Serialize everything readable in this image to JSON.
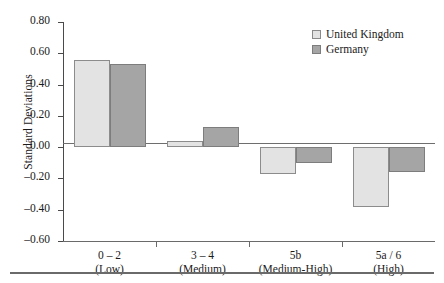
{
  "chart_data": {
    "type": "bar",
    "title": "",
    "xlabel": "",
    "ylabel": "Standard Deviations",
    "ylim": [
      -0.6,
      0.8
    ],
    "ytick_values": [
      0.8,
      0.6,
      0.4,
      0.2,
      0.0,
      -0.2,
      -0.4,
      -0.6
    ],
    "ytick_labels": [
      "0.80",
      "0.60",
      "0.40",
      "0.20",
      "0.00",
      "–0.20",
      "–0.40",
      "–0.60"
    ],
    "grid": false,
    "legend_position": "top-right",
    "zero_baseline": 0.0,
    "categories": [
      "0 – 2",
      "3 – 4",
      "5b",
      "5a / 6"
    ],
    "category_sublabels": [
      "(Low)",
      "(Medium)",
      "(Medium-High)",
      "(High)"
    ],
    "series": [
      {
        "name": "United Kingdom",
        "color": "#e3e3e3",
        "values": [
          0.56,
          0.04,
          -0.17,
          -0.38
        ]
      },
      {
        "name": "Germany",
        "color": "#a5a5a5",
        "values": [
          0.53,
          0.13,
          -0.1,
          -0.16
        ]
      }
    ]
  },
  "legend": {
    "items": [
      {
        "label": "United Kingdom",
        "swatch": "uk"
      },
      {
        "label": "Germany",
        "swatch": "de"
      }
    ]
  }
}
